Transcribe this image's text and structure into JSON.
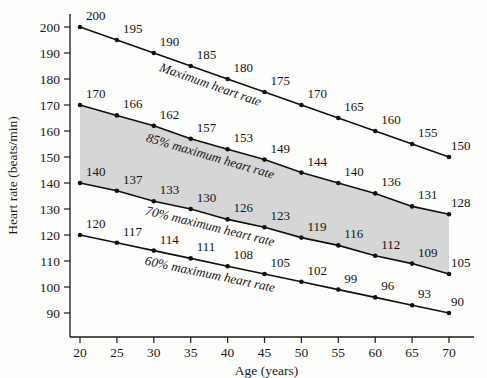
{
  "chart_data": {
    "type": "line",
    "title": "",
    "xlabel": "Age (years)",
    "ylabel": "Heart rate (beats/min)",
    "xlim": [
      17.5,
      73.5
    ],
    "ylim": [
      84,
      205
    ],
    "x_ticks": [
      20,
      25,
      30,
      35,
      40,
      45,
      50,
      55,
      60,
      65,
      70
    ],
    "y_ticks": [
      90,
      100,
      110,
      120,
      130,
      140,
      150,
      160,
      170,
      180,
      190,
      200
    ],
    "grid": false,
    "legend": "inline-labels",
    "x": [
      20,
      25,
      30,
      35,
      40,
      45,
      50,
      55,
      60,
      65,
      70
    ],
    "series": [
      {
        "name": "Maximum heart rate",
        "label_text": "Maximum heart rate",
        "values": [
          200,
          195,
          190,
          185,
          180,
          175,
          170,
          165,
          160,
          155,
          150
        ],
        "color": "#111111"
      },
      {
        "name": "85% maximum heart rate",
        "label_text": "85% maximum heart rate",
        "values": [
          170,
          166,
          162,
          157,
          153,
          149,
          144,
          140,
          136,
          131,
          128
        ],
        "color": "#111111"
      },
      {
        "name": "70% maximum heart rate",
        "label_text": "70% maximum heart rate",
        "values": [
          140,
          137,
          133,
          130,
          126,
          123,
          119,
          116,
          112,
          109,
          105
        ],
        "color": "#111111"
      },
      {
        "name": "60% maximum heart rate",
        "label_text": "60% maximum heart rate",
        "values": [
          120,
          117,
          114,
          111,
          108,
          105,
          102,
          99,
          96,
          93,
          90
        ],
        "color": "#111111"
      }
    ],
    "shaded_region": {
      "between": [
        "85% maximum heart rate",
        "70% maximum heart rate"
      ],
      "color": "#cfcfcf",
      "description": "target training zone"
    }
  }
}
